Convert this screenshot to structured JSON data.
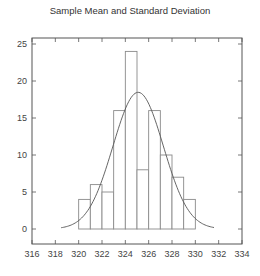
{
  "chart_data": {
    "type": "bar",
    "subtype": "histogram_with_normal_fit",
    "title": "Sample Mean and Standard Deviation",
    "xlabel": "",
    "ylabel": "",
    "xlim": [
      316,
      334
    ],
    "ylim": [
      -2,
      27
    ],
    "xticks": [
      316,
      318,
      320,
      322,
      324,
      326,
      328,
      330,
      332,
      334
    ],
    "yticks": [
      0,
      5,
      10,
      15,
      20,
      25
    ],
    "grid": false,
    "legend": null,
    "bins": [
      {
        "x0": 320,
        "x1": 321,
        "count": 4
      },
      {
        "x0": 321,
        "x1": 322,
        "count": 6
      },
      {
        "x0": 322,
        "x1": 323,
        "count": 5
      },
      {
        "x0": 323,
        "x1": 324,
        "count": 16
      },
      {
        "x0": 324,
        "x1": 325,
        "count": 24
      },
      {
        "x0": 325,
        "x1": 326,
        "count": 8
      },
      {
        "x0": 326,
        "x1": 327,
        "count": 16
      },
      {
        "x0": 327,
        "x1": 328,
        "count": 10
      },
      {
        "x0": 328,
        "x1": 329,
        "count": 7
      },
      {
        "x0": 329,
        "x1": 330,
        "count": 4
      }
    ],
    "categories": [
      "320-321",
      "321-322",
      "322-323",
      "323-324",
      "324-325",
      "325-326",
      "326-327",
      "327-328",
      "328-329",
      "329-330"
    ],
    "values": [
      4,
      6,
      5,
      16,
      24,
      8,
      16,
      10,
      7,
      4
    ],
    "fit_curve": {
      "type": "normal",
      "mean": 325.1,
      "std": 2.16,
      "n": 100,
      "bin_width": 1,
      "peak": 18.5,
      "x_range": [
        318.5,
        331.6
      ]
    },
    "colors": {
      "bar_stroke": "#8a8a8a",
      "bar_fill": "#ffffff",
      "curve": "#555555",
      "axis": "#555555"
    }
  }
}
